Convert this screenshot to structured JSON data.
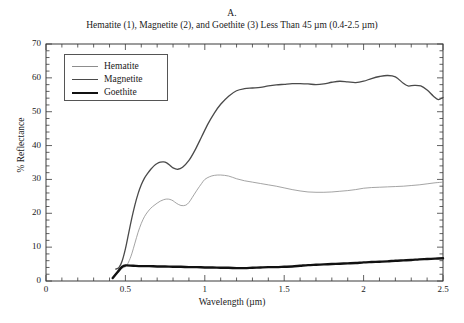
{
  "figure": {
    "panel_letter": "A.",
    "caption": "Hematite (1), Magnetite (2), and Goethite (3) Less Than 45 µm (0.4-2.5 µm)"
  },
  "legend": {
    "position": "top-left-inside",
    "items": [
      {
        "label": "Hematite",
        "color": "#8d8d8d",
        "width": 0.8
      },
      {
        "label": "Magnetite",
        "color": "#4a4a4a",
        "width": 1.3
      },
      {
        "label": "Goethite",
        "color": "#111111",
        "width": 2.4
      }
    ]
  },
  "axes": {
    "x_title": "Wavelength (µm)",
    "y_title": "% Reflectance",
    "x_ticks": [
      "0",
      "0.5",
      "1",
      "1.5",
      "2",
      "2.5"
    ],
    "y_ticks": [
      "0",
      "10",
      "20",
      "30",
      "40",
      "50",
      "60",
      "70"
    ]
  },
  "chart_data": {
    "type": "line",
    "title": "Hematite (1), Magnetite (2), and Goethite (3) Less Than 45 µm (0.4-2.5 µm)",
    "subtitle": "A.",
    "xlabel": "Wavelength (µm)",
    "ylabel": "% Reflectance",
    "xlim": [
      0,
      2.5
    ],
    "ylim": [
      0,
      70
    ],
    "xtick_step": 0.5,
    "xminor_step": 0.1,
    "ytick_step": 10,
    "yminor_step": 2,
    "grid": false,
    "legend_position": "upper left",
    "series": [
      {
        "name": "Hematite",
        "color": "#8d8d8d",
        "linewidth": 0.8,
        "x": [
          0.44,
          0.47,
          0.5,
          0.52,
          0.54,
          0.56,
          0.58,
          0.6,
          0.62,
          0.64,
          0.66,
          0.68,
          0.7,
          0.72,
          0.74,
          0.76,
          0.78,
          0.8,
          0.82,
          0.85,
          0.88,
          0.9,
          0.92,
          0.95,
          0.98,
          1.0,
          1.03,
          1.06,
          1.1,
          1.15,
          1.2,
          1.25,
          1.3,
          1.35,
          1.4,
          1.45,
          1.5,
          1.55,
          1.6,
          1.65,
          1.7,
          1.75,
          1.8,
          1.85,
          1.9,
          1.95,
          2.0,
          2.05,
          2.1,
          2.15,
          2.2,
          2.25,
          2.3,
          2.35,
          2.4,
          2.45,
          2.5
        ],
        "y": [
          3.6,
          3.8,
          4.2,
          5.6,
          8.0,
          11.2,
          14.4,
          17.0,
          19.0,
          20.4,
          21.5,
          22.3,
          23.0,
          23.6,
          24.0,
          24.2,
          24.1,
          23.7,
          23.0,
          22.3,
          22.4,
          23.2,
          24.6,
          26.8,
          28.8,
          30.0,
          30.8,
          31.2,
          31.3,
          31.0,
          30.2,
          29.6,
          29.2,
          28.8,
          28.4,
          28.0,
          27.5,
          27.0,
          26.6,
          26.3,
          26.2,
          26.2,
          26.3,
          26.5,
          26.7,
          27.0,
          27.4,
          27.6,
          27.7,
          27.8,
          27.9,
          28.0,
          28.2,
          28.4,
          28.7,
          29.0,
          29.2
        ]
      },
      {
        "name": "Magnetite",
        "color": "#4a4a4a",
        "linewidth": 1.3,
        "x": [
          0.44,
          0.46,
          0.48,
          0.5,
          0.52,
          0.54,
          0.56,
          0.58,
          0.6,
          0.62,
          0.64,
          0.66,
          0.68,
          0.7,
          0.72,
          0.74,
          0.76,
          0.78,
          0.8,
          0.83,
          0.86,
          0.9,
          0.94,
          0.98,
          1.02,
          1.06,
          1.1,
          1.15,
          1.2,
          1.25,
          1.3,
          1.35,
          1.4,
          1.45,
          1.5,
          1.55,
          1.6,
          1.65,
          1.7,
          1.75,
          1.8,
          1.85,
          1.9,
          1.95,
          2.0,
          2.05,
          2.1,
          2.15,
          2.2,
          2.25,
          2.28,
          2.32,
          2.36,
          2.4,
          2.44,
          2.47,
          2.5
        ],
        "y": [
          3.5,
          4.0,
          6.0,
          9.5,
          14.0,
          18.5,
          22.5,
          25.8,
          28.4,
          30.4,
          31.8,
          33.0,
          34.0,
          34.7,
          35.1,
          35.2,
          34.9,
          34.2,
          33.4,
          33.0,
          33.6,
          35.6,
          38.8,
          42.6,
          46.4,
          49.6,
          52.2,
          54.6,
          56.2,
          56.8,
          57.0,
          57.2,
          57.6,
          57.9,
          58.1,
          58.3,
          58.3,
          58.2,
          58.0,
          58.2,
          58.7,
          59.0,
          58.8,
          58.6,
          59.0,
          59.8,
          60.4,
          60.7,
          60.3,
          58.4,
          57.6,
          57.8,
          57.6,
          56.4,
          54.6,
          53.6,
          54.2
        ]
      },
      {
        "name": "Goethite",
        "color": "#111111",
        "linewidth": 2.4,
        "x": [
          0.42,
          0.45,
          0.48,
          0.5,
          0.55,
          0.6,
          0.65,
          0.7,
          0.75,
          0.8,
          0.85,
          0.9,
          0.95,
          1.0,
          1.05,
          1.1,
          1.15,
          1.2,
          1.25,
          1.3,
          1.35,
          1.4,
          1.45,
          1.5,
          1.55,
          1.6,
          1.65,
          1.7,
          1.75,
          1.8,
          1.85,
          1.9,
          1.95,
          2.0,
          2.05,
          2.1,
          2.15,
          2.2,
          2.25,
          2.3,
          2.35,
          2.4,
          2.45,
          2.5
        ],
        "y": [
          0.9,
          2.6,
          4.2,
          4.6,
          4.5,
          4.4,
          4.4,
          4.3,
          4.3,
          4.2,
          4.2,
          4.1,
          4.1,
          4.0,
          4.0,
          3.9,
          3.9,
          3.8,
          3.8,
          3.9,
          4.0,
          4.1,
          4.1,
          4.2,
          4.3,
          4.5,
          4.7,
          4.8,
          4.9,
          5.0,
          5.1,
          5.2,
          5.3,
          5.5,
          5.6,
          5.7,
          5.8,
          6.0,
          6.1,
          6.2,
          6.4,
          6.5,
          6.6,
          6.7
        ]
      }
    ]
  }
}
